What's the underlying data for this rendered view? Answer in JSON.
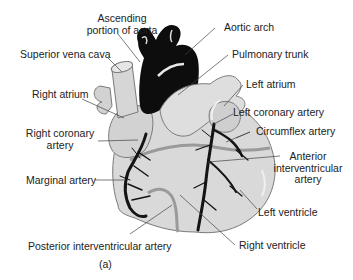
{
  "diagram": {
    "caption": "(a)",
    "colors": {
      "heart_fill": "#d9d9d9",
      "heart_outline": "#7a7a7a",
      "aorta": "#0d0d0d",
      "arteries": "#141414",
      "posterior_artery": "#9a9a9a",
      "leader_lines": "#444444"
    },
    "labels": {
      "ascending_aorta_line1": "Ascending",
      "ascending_aorta_line2": "portion of aorta",
      "superior_vena_cava": "Superior vena cava",
      "right_atrium": "Right atrium",
      "right_coronary_line1": "Right coronary",
      "right_coronary_line2": "artery",
      "marginal_artery": "Marginal artery",
      "posterior_interventricular": "Posterior interventricular artery",
      "aortic_arch": "Aortic arch",
      "pulmonary_trunk": "Pulmonary trunk",
      "left_atrium": "Left atrium",
      "left_coronary": "Left coronary artery",
      "circumflex": "Circumflex artery",
      "anterior_iv_line1": "Anterior",
      "anterior_iv_line2": "interventricular",
      "anterior_iv_line3": "artery",
      "left_ventricle": "Left ventricle",
      "right_ventricle": "Right ventricle"
    }
  }
}
